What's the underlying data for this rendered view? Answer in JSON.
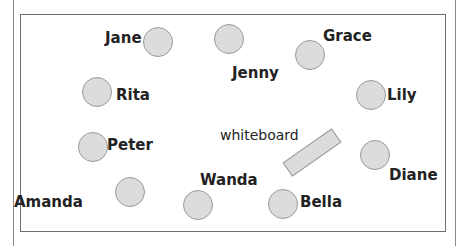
{
  "diagram": {
    "type": "classroom-seating",
    "whiteboard_label": "whiteboard",
    "colors": {
      "seat_fill": "#dcdcdc",
      "seat_stroke": "#9a9a9a",
      "border": "#6f6f6f",
      "text": "#222222"
    },
    "people": [
      {
        "name": "Jane",
        "seat": [
          143,
          27
        ],
        "label": [
          105,
          31
        ]
      },
      {
        "name": "Jenny",
        "seat": [
          214,
          24
        ],
        "label": [
          232,
          66
        ]
      },
      {
        "name": "Grace",
        "seat": [
          295,
          40
        ],
        "label": [
          323,
          29
        ]
      },
      {
        "name": "Rita",
        "seat": [
          82,
          77
        ],
        "label": [
          116,
          88
        ]
      },
      {
        "name": "Lily",
        "seat": [
          356,
          80
        ],
        "label": [
          387,
          88
        ]
      },
      {
        "name": "Peter",
        "seat": [
          78,
          132
        ],
        "label": [
          107,
          138
        ]
      },
      {
        "name": "Diane",
        "seat": [
          360,
          140
        ],
        "label": [
          389,
          168
        ]
      },
      {
        "name": "Amanda",
        "seat": [
          115,
          177
        ],
        "label": [
          14,
          195
        ]
      },
      {
        "name": "Wanda",
        "seat": [
          183,
          190
        ],
        "label": [
          200,
          173
        ]
      },
      {
        "name": "Bella",
        "seat": [
          268,
          189
        ],
        "label": [
          300,
          195
        ]
      }
    ]
  }
}
